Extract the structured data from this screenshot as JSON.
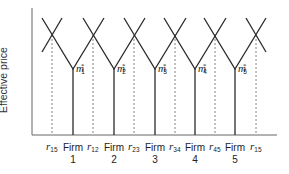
{
  "diagram": {
    "y_axis_label": "Effective price",
    "firms": [
      {
        "label_line1": "Firm",
        "label_line2": "1",
        "markup": "m",
        "markup_sub": "1",
        "markup_sup": "*"
      },
      {
        "label_line1": "Firm",
        "label_line2": "2",
        "markup": "m",
        "markup_sub": "2",
        "markup_sup": "*"
      },
      {
        "label_line1": "Firm",
        "label_line2": "3",
        "markup": "m",
        "markup_sub": "3",
        "markup_sup": "*"
      },
      {
        "label_line1": "Firm",
        "label_line2": "4",
        "markup": "m",
        "markup_sub": "4",
        "markup_sup": "*"
      },
      {
        "label_line1": "Firm",
        "label_line2": "5",
        "markup": "m",
        "markup_sub": "5",
        "markup_sup": "*"
      }
    ],
    "boundaries": [
      {
        "symbol": "r",
        "sub": "15"
      },
      {
        "symbol": "r",
        "sub": "12"
      },
      {
        "symbol": "r",
        "sub": "23"
      },
      {
        "symbol": "r",
        "sub": "34"
      },
      {
        "symbol": "r",
        "sub": "45"
      },
      {
        "symbol": "r",
        "sub": "15"
      }
    ],
    "colors": {
      "line": "#2a2a2a",
      "dashed": "#777777",
      "axis": "#555555"
    }
  }
}
